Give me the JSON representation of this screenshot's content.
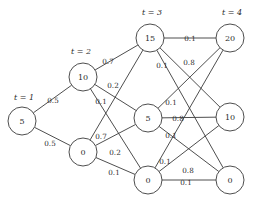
{
  "figure": {
    "type": "trellis-graph",
    "background_color": "#ffffff",
    "stroke_color": "#3a3a3a",
    "text_color": "#2b2b2b"
  },
  "stage_labels": [
    {
      "id": "stage-t1",
      "text": "t = 1",
      "x": 24,
      "y": 97
    },
    {
      "id": "stage-t2",
      "text": "t = 2",
      "x": 81,
      "y": 51
    },
    {
      "id": "stage-t3",
      "text": "t = 3",
      "x": 152,
      "y": 12
    },
    {
      "id": "stage-t4",
      "text": "t = 4",
      "x": 232,
      "y": 12
    }
  ],
  "nodes": [
    {
      "id": "n-t1-5",
      "stage": 1,
      "value": "5",
      "cx": 22,
      "cy": 121,
      "r": 14
    },
    {
      "id": "n-t2-10",
      "stage": 2,
      "value": "10",
      "cx": 83,
      "cy": 77,
      "r": 14
    },
    {
      "id": "n-t2-0",
      "stage": 2,
      "value": "0",
      "cx": 83,
      "cy": 152,
      "r": 14
    },
    {
      "id": "n-t3-15",
      "stage": 3,
      "value": "15",
      "cx": 150,
      "cy": 38,
      "r": 14
    },
    {
      "id": "n-t3-5",
      "stage": 3,
      "value": "5",
      "cx": 148,
      "cy": 118,
      "r": 14
    },
    {
      "id": "n-t3-0",
      "stage": 3,
      "value": "0",
      "cx": 148,
      "cy": 180,
      "r": 14
    },
    {
      "id": "n-t4-20",
      "stage": 4,
      "value": "20",
      "cx": 230,
      "cy": 38,
      "r": 14
    },
    {
      "id": "n-t4-10",
      "stage": 4,
      "value": "10",
      "cx": 230,
      "cy": 117,
      "r": 14
    },
    {
      "id": "n-t4-0",
      "stage": 4,
      "value": "0",
      "cx": 230,
      "cy": 180,
      "r": 14
    }
  ],
  "edges": [
    {
      "id": "e-t1-5__t2-10",
      "from": "n-t1-5",
      "to": "n-t2-10",
      "weight": "0.5"
    },
    {
      "id": "e-t1-5__t2-0",
      "from": "n-t1-5",
      "to": "n-t2-0",
      "weight": "0.5"
    },
    {
      "id": "e-t2-10__t3-15",
      "from": "n-t2-10",
      "to": "n-t3-15",
      "weight": "0.7"
    },
    {
      "id": "e-t2-10__t3-5",
      "from": "n-t2-10",
      "to": "n-t3-5",
      "weight": "0.2"
    },
    {
      "id": "e-t2-10__t3-0",
      "from": "n-t2-10",
      "to": "n-t3-0",
      "weight": "0.1"
    },
    {
      "id": "e-t2-0__t3-15",
      "from": "n-t2-0",
      "to": "n-t3-15",
      "weight": "0.7"
    },
    {
      "id": "e-t2-0__t3-5",
      "from": "n-t2-0",
      "to": "n-t3-5",
      "weight": "0.2"
    },
    {
      "id": "e-t2-0__t3-0",
      "from": "n-t2-0",
      "to": "n-t3-0",
      "weight": "0.1"
    },
    {
      "id": "e-t3-15__t4-20",
      "from": "n-t3-15",
      "to": "n-t4-20",
      "weight": "0.1"
    },
    {
      "id": "e-t3-15__t4-10",
      "from": "n-t3-15",
      "to": "n-t4-10",
      "weight": "0.1"
    },
    {
      "id": "e-t3-15__t4-0",
      "from": "n-t3-15",
      "to": "n-t4-0",
      "weight": "0.8"
    },
    {
      "id": "e-t3-5__t4-20",
      "from": "n-t3-5",
      "to": "n-t4-20",
      "weight": "0.1"
    },
    {
      "id": "e-t3-5__t4-10",
      "from": "n-t3-5",
      "to": "n-t4-10",
      "weight": "0.8"
    },
    {
      "id": "e-t3-5__t4-0",
      "from": "n-t3-5",
      "to": "n-t4-0",
      "weight": "0.1"
    },
    {
      "id": "e-t3-0__t4-20",
      "from": "n-t3-0",
      "to": "n-t4-20",
      "weight": "0.1"
    },
    {
      "id": "e-t3-0__t4-10",
      "from": "n-t3-0",
      "to": "n-t4-10",
      "weight": "0.8"
    },
    {
      "id": "e-t3-0__t4-0",
      "from": "n-t3-0",
      "to": "n-t4-0",
      "weight": "0.1"
    }
  ],
  "edge_labels": [
    {
      "id": "lbl-0.5-a",
      "text": "0.5",
      "x": 53,
      "y": 100
    },
    {
      "id": "lbl-0.5-b",
      "text": "0.5",
      "x": 50,
      "y": 143
    },
    {
      "id": "lbl-0.7-a",
      "text": "0.7",
      "x": 108,
      "y": 61
    },
    {
      "id": "lbl-0.2-a",
      "text": "0.2",
      "x": 113,
      "y": 85
    },
    {
      "id": "lbl-0.1-a",
      "text": "0.1",
      "x": 101,
      "y": 101
    },
    {
      "id": "lbl-0.7-b",
      "text": "0.7",
      "x": 101,
      "y": 136
    },
    {
      "id": "lbl-0.2-b",
      "text": "0.2",
      "x": 115,
      "y": 152
    },
    {
      "id": "lbl-0.1-b",
      "text": "0.1",
      "x": 114,
      "y": 172
    },
    {
      "id": "lbl-0.1-c",
      "text": "0.1",
      "x": 190,
      "y": 38
    },
    {
      "id": "lbl-0.1-d",
      "text": "0.1",
      "x": 162,
      "y": 65
    },
    {
      "id": "lbl-0.8-a",
      "text": "0.8",
      "x": 189,
      "y": 62
    },
    {
      "id": "lbl-0.1-e",
      "text": "0.1",
      "x": 171,
      "y": 102
    },
    {
      "id": "lbl-0.8-b",
      "text": "0.8",
      "x": 178,
      "y": 118
    },
    {
      "id": "lbl-0.1-f",
      "text": "0.1",
      "x": 171,
      "y": 135
    },
    {
      "id": "lbl-0.1-g",
      "text": "0.1",
      "x": 165,
      "y": 161
    },
    {
      "id": "lbl-0.8-c",
      "text": "0.8",
      "x": 188,
      "y": 170
    },
    {
      "id": "lbl-0.1-h",
      "text": "0.1",
      "x": 186,
      "y": 182
    }
  ]
}
